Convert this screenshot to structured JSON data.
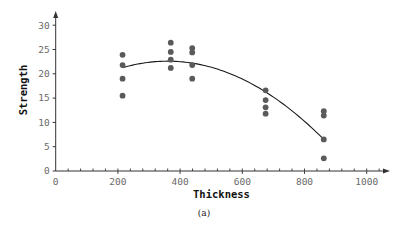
{
  "chart_data": {
    "type": "scatter",
    "title": "",
    "caption": "(a)",
    "xlabel": "Thickness",
    "ylabel": "Strength",
    "xlim": [
      0,
      1000
    ],
    "ylim": [
      0,
      30
    ],
    "x_ticks": [
      0,
      200,
      400,
      600,
      800,
      1000
    ],
    "x_minor_step": 40,
    "y_ticks": [
      0,
      5,
      10,
      15,
      20,
      25,
      30
    ],
    "grid": false,
    "legend": null,
    "series": [
      {
        "name": "observations",
        "kind": "scatter",
        "color": "#5a5a5a",
        "points": [
          {
            "x": 215,
            "y": 23.9
          },
          {
            "x": 215,
            "y": 21.8
          },
          {
            "x": 215,
            "y": 19.0
          },
          {
            "x": 215,
            "y": 15.5
          },
          {
            "x": 370,
            "y": 26.4
          },
          {
            "x": 370,
            "y": 24.5
          },
          {
            "x": 370,
            "y": 22.9
          },
          {
            "x": 370,
            "y": 21.2
          },
          {
            "x": 439,
            "y": 25.3
          },
          {
            "x": 439,
            "y": 24.4
          },
          {
            "x": 439,
            "y": 21.8
          },
          {
            "x": 439,
            "y": 19.0
          },
          {
            "x": 675,
            "y": 16.6
          },
          {
            "x": 675,
            "y": 14.6
          },
          {
            "x": 675,
            "y": 13.1
          },
          {
            "x": 675,
            "y": 11.8
          },
          {
            "x": 862,
            "y": 12.3
          },
          {
            "x": 862,
            "y": 11.4
          },
          {
            "x": 862,
            "y": 6.5
          },
          {
            "x": 862,
            "y": 2.6
          }
        ]
      },
      {
        "name": "quadratic fit",
        "kind": "line",
        "color": "#1a1a1a",
        "x_range": [
          215,
          862
        ],
        "model": {
          "vertex_x": 360,
          "vertex_y": 22.6,
          "a": -6.39e-05
        }
      }
    ]
  },
  "colors": {
    "axis": "#333333",
    "points": "#5a5a5a",
    "curve": "#1a1a1a"
  }
}
